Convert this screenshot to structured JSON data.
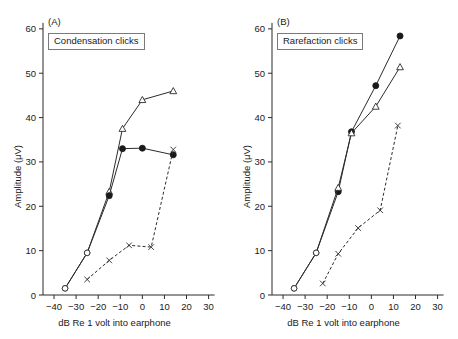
{
  "figure": {
    "background_color": "#ffffff",
    "line_color": "#2b2b2b"
  },
  "panels": [
    {
      "letter": "(A)",
      "legend_label": "Condensation clicks"
    },
    {
      "letter": "(B)",
      "legend_label": "Rarefaction clicks"
    }
  ],
  "axes": {
    "xlabel": "dB Re 1 volt into earphone",
    "ylabel": "Amplitude (μV)",
    "xticks": [
      "−40",
      "−30",
      "−20",
      "−10",
      "0",
      "10",
      "20",
      "30"
    ],
    "yticks": [
      "0",
      "10",
      "20",
      "30",
      "40",
      "50",
      "60"
    ]
  },
  "chart_data": [
    {
      "type": "line",
      "title": "(A)",
      "annotation": "Condensation clicks",
      "xlabel": "dB Re 1 volt into earphone",
      "ylabel": "Amplitude (μV)",
      "xlim": [
        -45,
        32
      ],
      "ylim": [
        0,
        62
      ],
      "xticks": [
        -40,
        -30,
        -20,
        -10,
        0,
        10,
        20,
        30
      ],
      "yticks": [
        0,
        10,
        20,
        30,
        40,
        50,
        60
      ],
      "grid": false,
      "legend": "none",
      "series": [
        {
          "name": "open-triangle",
          "marker": "triangle-open",
          "linestyle": "solid",
          "x": [
            -35,
            -25,
            -15,
            -9,
            0,
            14
          ],
          "y": [
            1.5,
            9.5,
            23.3,
            37.5,
            44,
            46
          ]
        },
        {
          "name": "filled-circle",
          "marker": "circle-filled",
          "linestyle": "solid",
          "x": [
            -35,
            -25,
            -15,
            -9,
            0,
            14
          ],
          "y": [
            1.5,
            9.5,
            22.4,
            33,
            33.1,
            31.6
          ]
        },
        {
          "name": "cross",
          "marker": "x",
          "linestyle": "dashed",
          "x": [
            -25,
            -15,
            -6,
            4,
            14
          ],
          "y": [
            3.5,
            7.8,
            11.2,
            10.8,
            32.8
          ]
        }
      ]
    },
    {
      "type": "line",
      "title": "(B)",
      "annotation": "Rarefaction clicks",
      "xlabel": "dB Re 1 volt into earphone",
      "ylabel": "Amplitude (μV)",
      "xlim": [
        -45,
        32
      ],
      "ylim": [
        0,
        62
      ],
      "xticks": [
        -40,
        -30,
        -20,
        -10,
        0,
        10,
        20,
        30
      ],
      "yticks": [
        0,
        10,
        20,
        30,
        40,
        50,
        60
      ],
      "grid": false,
      "legend": "none",
      "series": [
        {
          "name": "filled-circle",
          "marker": "circle-filled",
          "linestyle": "solid",
          "x": [
            -35,
            -25,
            -15,
            -9,
            2,
            13
          ],
          "y": [
            1.5,
            9.5,
            23.3,
            36.8,
            47.2,
            58.4
          ]
        },
        {
          "name": "open-triangle",
          "marker": "triangle-open",
          "linestyle": "solid",
          "x": [
            -35,
            -25,
            -15,
            -9,
            2,
            13
          ],
          "y": [
            1.5,
            9.5,
            24.2,
            36.5,
            42.5,
            51.4
          ]
        },
        {
          "name": "cross",
          "marker": "x",
          "linestyle": "dashed",
          "x": [
            -22,
            -15,
            -6,
            4,
            12
          ],
          "y": [
            2.6,
            9.3,
            15.1,
            19.1,
            38.2
          ]
        }
      ]
    }
  ]
}
